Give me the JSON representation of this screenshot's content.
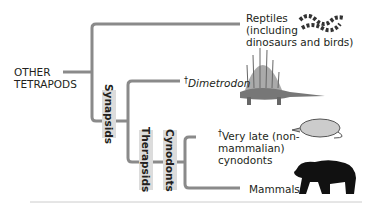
{
  "root_label": "OTHER TETRAPODS",
  "root_line1": "OTHER",
  "root_line2": "TETRAPODS",
  "taxa": {
    "reptiles": {
      "line1": "Reptiles",
      "line2": "(including",
      "line3": "dinosaurs and birds)"
    },
    "dimetrodon": {
      "dagger": "†",
      "name": "Dimetrodon"
    },
    "cynodonts_late": {
      "dagger": "†",
      "line1": "Very late (non-",
      "line2": "mammalian)",
      "line3": "cynodonts"
    },
    "mammals": {
      "name": "Mammals"
    }
  },
  "groups": {
    "synapsids": "Synapsids",
    "therapsids": "Therapsids",
    "cynodonts": "Cynodonts"
  },
  "icons": {
    "reptile": "snake-icon",
    "dimetrodon": "dimetrodon-icon",
    "cynodont": "cynodont-icon",
    "mammal": "bear-icon"
  },
  "colors": {
    "branch": "#8a8a8a",
    "label_bg": "#dcdcdc",
    "text": "#231f20"
  }
}
